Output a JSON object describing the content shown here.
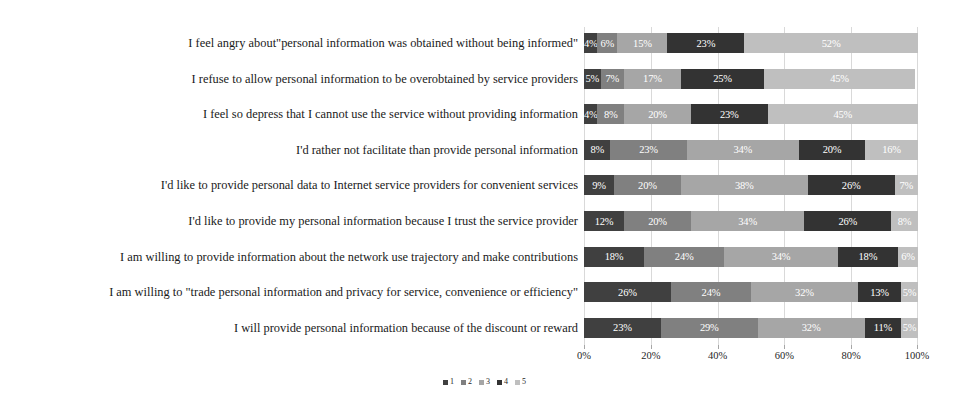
{
  "chart_data": {
    "type": "bar",
    "subtype": "horizontal-100-percent-stacked",
    "title": "",
    "xlabel": "",
    "ylabel": "",
    "xlim": [
      0,
      100
    ],
    "xticks": [
      "0%",
      "20%",
      "40%",
      "60%",
      "80%",
      "100%"
    ],
    "xtick_values": [
      0,
      20,
      40,
      60,
      80,
      100
    ],
    "grid": true,
    "grid_axis": "x",
    "legend_position": "bottom-center",
    "categories": [
      "I feel angry about\"personal information was obtained without being informed\"",
      "I refuse to allow personal information to be overobtained by service providers",
      "I feel so depress that I cannot use the service without providing information",
      "I'd rather not facilitate than provide personal information",
      "I'd like to provide personal data to Internet service providers for convenient services",
      "I'd like to provide my personal information because I trust the service provider",
      "I am willing to provide information about the network use trajectory and make contributions",
      "I am willing to \"trade personal information and privacy for service, convenience or efficiency\"",
      "I will provide personal information because of the discount or reward"
    ],
    "series": [
      {
        "name": "1",
        "color": "#404040",
        "values": [
          4,
          5,
          4,
          8,
          9,
          12,
          18,
          26,
          23
        ]
      },
      {
        "name": "2",
        "color": "#808080",
        "values": [
          6,
          7,
          8,
          23,
          20,
          20,
          24,
          24,
          29
        ]
      },
      {
        "name": "3",
        "color": "#a6a6a6",
        "values": [
          15,
          17,
          20,
          34,
          38,
          34,
          34,
          32,
          32
        ]
      },
      {
        "name": "4",
        "color": "#333333",
        "values": [
          23,
          25,
          23,
          20,
          26,
          26,
          18,
          13,
          11
        ]
      },
      {
        "name": "5",
        "color": "#bfbfbf",
        "values": [
          52,
          45,
          45,
          16,
          7,
          8,
          6,
          5,
          5
        ]
      }
    ],
    "data_label_suffix": "%",
    "rows": [
      {
        "label": "I feel angry about\"personal information was obtained without being informed\"",
        "segments": [
          {
            "series": "1",
            "value": 4,
            "text": "4%"
          },
          {
            "series": "2",
            "value": 6,
            "text": "6%"
          },
          {
            "series": "3",
            "value": 15,
            "text": "15%"
          },
          {
            "series": "4",
            "value": 23,
            "text": "23%"
          },
          {
            "series": "5",
            "value": 52,
            "text": "52%"
          }
        ]
      },
      {
        "label": "I refuse to allow personal information to be overobtained by service providers",
        "segments": [
          {
            "series": "1",
            "value": 5,
            "text": "5%"
          },
          {
            "series": "2",
            "value": 7,
            "text": "7%"
          },
          {
            "series": "3",
            "value": 17,
            "text": "17%"
          },
          {
            "series": "4",
            "value": 25,
            "text": "25%"
          },
          {
            "series": "5",
            "value": 45,
            "text": "45%"
          }
        ]
      },
      {
        "label": "I feel so depress that I cannot use the service without providing information",
        "segments": [
          {
            "series": "1",
            "value": 4,
            "text": "4%"
          },
          {
            "series": "2",
            "value": 8,
            "text": "8%"
          },
          {
            "series": "3",
            "value": 20,
            "text": "20%"
          },
          {
            "series": "4",
            "value": 23,
            "text": "23%"
          },
          {
            "series": "5",
            "value": 45,
            "text": "45%"
          }
        ]
      },
      {
        "label": "I'd rather not facilitate than provide personal information",
        "segments": [
          {
            "series": "1",
            "value": 8,
            "text": "8%"
          },
          {
            "series": "2",
            "value": 23,
            "text": "23%"
          },
          {
            "series": "3",
            "value": 34,
            "text": "34%"
          },
          {
            "series": "4",
            "value": 20,
            "text": "20%"
          },
          {
            "series": "5",
            "value": 16,
            "text": "16%"
          }
        ]
      },
      {
        "label": "I'd like to provide personal data to Internet service providers for convenient services",
        "segments": [
          {
            "series": "1",
            "value": 9,
            "text": "9%"
          },
          {
            "series": "2",
            "value": 20,
            "text": "20%"
          },
          {
            "series": "3",
            "value": 38,
            "text": "38%"
          },
          {
            "series": "4",
            "value": 26,
            "text": "26%"
          },
          {
            "series": "5",
            "value": 7,
            "text": "7%"
          }
        ]
      },
      {
        "label": "I'd like to provide my personal information because I trust the service provider",
        "segments": [
          {
            "series": "1",
            "value": 12,
            "text": "12%"
          },
          {
            "series": "2",
            "value": 20,
            "text": "20%"
          },
          {
            "series": "3",
            "value": 34,
            "text": "34%"
          },
          {
            "series": "4",
            "value": 26,
            "text": "26%"
          },
          {
            "series": "5",
            "value": 8,
            "text": "8%"
          }
        ]
      },
      {
        "label": "I am willing to provide information about the network use trajectory and make contributions",
        "segments": [
          {
            "series": "1",
            "value": 18,
            "text": "18%"
          },
          {
            "series": "2",
            "value": 24,
            "text": "24%"
          },
          {
            "series": "3",
            "value": 34,
            "text": "34%"
          },
          {
            "series": "4",
            "value": 18,
            "text": "18%"
          },
          {
            "series": "5",
            "value": 6,
            "text": "6%"
          }
        ]
      },
      {
        "label": "I am willing to \"trade personal information and privacy for service, convenience or efficiency\"",
        "segments": [
          {
            "series": "1",
            "value": 26,
            "text": "26%"
          },
          {
            "series": "2",
            "value": 24,
            "text": "24%"
          },
          {
            "series": "3",
            "value": 32,
            "text": "32%"
          },
          {
            "series": "4",
            "value": 13,
            "text": "13%"
          },
          {
            "series": "5",
            "value": 5,
            "text": "5%"
          }
        ]
      },
      {
        "label": "I will provide personal information because of the discount or reward",
        "segments": [
          {
            "series": "1",
            "value": 23,
            "text": "23%"
          },
          {
            "series": "2",
            "value": 29,
            "text": "29%"
          },
          {
            "series": "3",
            "value": 32,
            "text": "32%"
          },
          {
            "series": "4",
            "value": 11,
            "text": "11%"
          },
          {
            "series": "5",
            "value": 5,
            "text": "5%"
          }
        ]
      }
    ],
    "legend": [
      {
        "label": "1",
        "color": "#404040"
      },
      {
        "label": "2",
        "color": "#808080"
      },
      {
        "label": "3",
        "color": "#a6a6a6"
      },
      {
        "label": "4",
        "color": "#333333"
      },
      {
        "label": "5",
        "color": "#bfbfbf"
      }
    ]
  }
}
